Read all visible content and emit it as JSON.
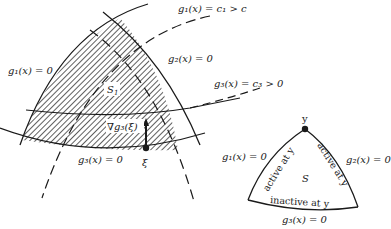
{
  "left_figure": {
    "region_label": "S",
    "region_subscript": "1",
    "labels": {
      "g1_zero": "g₁(x) = 0",
      "g1_level": "g₁(x) = c₁ > c",
      "g2_zero": "g₂(x) = 0",
      "g3_level": "g₃(x) = c₃ > 0",
      "g3_zero": "g₃(x) = 0",
      "gradient": "∇g₃(ξ)",
      "point": "ξ"
    }
  },
  "right_figure": {
    "region_label": "S",
    "vertex_label": "y",
    "labels": {
      "g1_zero": "g₁(x) = 0",
      "g2_zero": "g₂(x) = 0",
      "g3_zero": "g₃(x) = 0",
      "left_edge": "active at y",
      "right_edge": "active at y",
      "bottom_edge": "inactive at y"
    }
  },
  "colors": {
    "ink": "#1a1a1a",
    "background": "#ffffff"
  }
}
